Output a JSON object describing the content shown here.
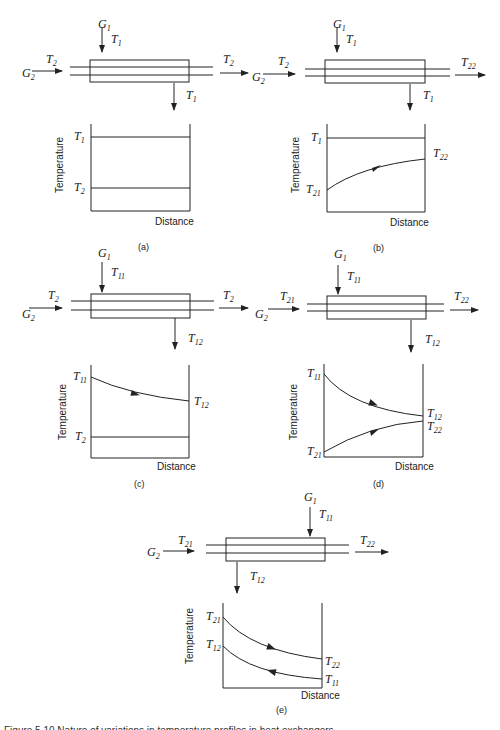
{
  "figure": {
    "header_text": "",
    "caption": "Figure 5.10 Nature of variations in temperature profiles in heat exchangers",
    "panels": [
      {
        "id": "a",
        "label": "(a)",
        "stream1": {
          "name": "G",
          "sub": "1",
          "in": {
            "T": "T",
            "sub": "1"
          },
          "out": {
            "T": "T",
            "sub": "1"
          }
        },
        "stream2": {
          "name": "G",
          "sub": "2",
          "in": {
            "T": "T",
            "sub": "2"
          },
          "out": {
            "T": "T",
            "sub": "2"
          }
        },
        "graph": {
          "ylabel": "Temperature",
          "xlabel": "Distance",
          "left_labels": [
            {
              "T": "T",
              "sub": "1"
            },
            {
              "T": "T",
              "sub": "2"
            }
          ],
          "right_labels": []
        }
      },
      {
        "id": "b",
        "label": "(b)",
        "stream1": {
          "name": "G",
          "sub": "1",
          "in": {
            "T": "T",
            "sub": "1"
          },
          "out": {
            "T": "T",
            "sub": "1"
          }
        },
        "stream2": {
          "name": "G",
          "sub": "2",
          "in": {
            "T": "T",
            "sub": "2"
          },
          "out": {
            "T": "T",
            "sub": "22"
          }
        },
        "graph": {
          "ylabel": "Temperature",
          "xlabel": "Distance",
          "left_labels": [
            {
              "T": "T",
              "sub": "1"
            },
            {
              "T": "T",
              "sub": "21"
            }
          ],
          "right_labels": [
            {
              "T": "T",
              "sub": "22"
            }
          ]
        }
      },
      {
        "id": "c",
        "label": "(c)",
        "stream1": {
          "name": "G",
          "sub": "1",
          "in": {
            "T": "T",
            "sub": "11"
          },
          "out": {
            "T": "T",
            "sub": "12"
          }
        },
        "stream2": {
          "name": "G",
          "sub": "2",
          "in": {
            "T": "T",
            "sub": "2"
          },
          "out": {
            "T": "T",
            "sub": "2"
          }
        },
        "graph": {
          "ylabel": "Temperature",
          "xlabel": "Distance",
          "left_labels": [
            {
              "T": "T",
              "sub": "11"
            },
            {
              "T": "T",
              "sub": "2"
            }
          ],
          "right_labels": [
            {
              "T": "T",
              "sub": "12"
            }
          ]
        }
      },
      {
        "id": "d",
        "label": "(d)",
        "stream1": {
          "name": "G",
          "sub": "1",
          "in": {
            "T": "T",
            "sub": "11"
          },
          "out": {
            "T": "T",
            "sub": "12"
          }
        },
        "stream2": {
          "name": "G",
          "sub": "2",
          "in": {
            "T": "T",
            "sub": "21"
          },
          "out": {
            "T": "T",
            "sub": "22"
          }
        },
        "graph": {
          "ylabel": "Temperature",
          "xlabel": "Distance",
          "left_labels": [
            {
              "T": "T",
              "sub": "11"
            },
            {
              "T": "T",
              "sub": "21"
            }
          ],
          "right_labels": [
            {
              "T": "T",
              "sub": "12"
            },
            {
              "T": "T",
              "sub": "22"
            }
          ]
        }
      },
      {
        "id": "e",
        "label": "(e)",
        "stream1": {
          "name": "G",
          "sub": "1",
          "in": {
            "T": "T",
            "sub": "11"
          },
          "out": {
            "T": "T",
            "sub": "12"
          }
        },
        "stream2": {
          "name": "G",
          "sub": "2",
          "in": {
            "T": "T",
            "sub": "21"
          },
          "out": {
            "T": "T",
            "sub": "22"
          }
        },
        "graph": {
          "ylabel": "Temperature",
          "xlabel": "Distance",
          "left_labels": [
            {
              "T": "T",
              "sub": "21"
            },
            {
              "T": "T",
              "sub": "12"
            }
          ],
          "right_labels": [
            {
              "T": "T",
              "sub": "22"
            },
            {
              "T": "T",
              "sub": "11"
            }
          ]
        }
      }
    ]
  }
}
